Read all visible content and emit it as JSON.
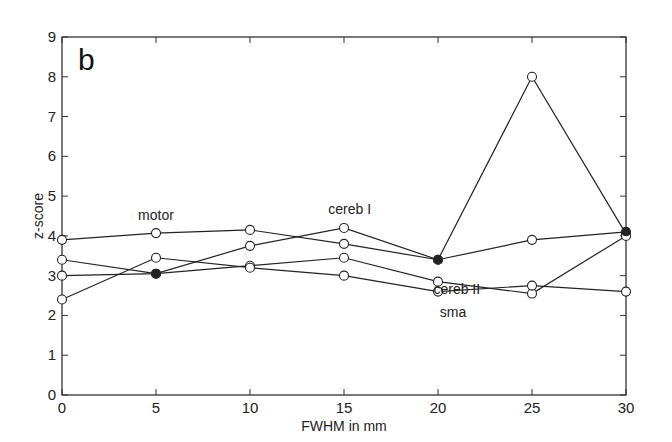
{
  "chart_data": {
    "type": "line",
    "panel_label": "b",
    "title": "",
    "xlabel": "FWHM in mm",
    "ylabel": "z-score",
    "xlim": [
      0,
      30
    ],
    "ylim": [
      0,
      9
    ],
    "x": [
      0,
      5,
      10,
      15,
      20,
      25,
      30
    ],
    "xticks": [
      0,
      5,
      10,
      15,
      20,
      25,
      30
    ],
    "yticks": [
      0,
      1,
      2,
      3,
      4,
      5,
      6,
      7,
      8,
      9
    ],
    "grid": false,
    "legend": "none (inline annotations)",
    "series": [
      {
        "name": "motor",
        "values": [
          3.9,
          4.07,
          4.15,
          3.8,
          3.4,
          3.9,
          4.1
        ]
      },
      {
        "name": "cereb I",
        "values": [
          3.4,
          3.05,
          3.75,
          4.2,
          3.4,
          8.0,
          4.05
        ]
      },
      {
        "name": "cereb II",
        "values": [
          3.0,
          3.05,
          3.25,
          3.45,
          2.85,
          2.55,
          4.0
        ]
      },
      {
        "name": "sma",
        "values": [
          2.4,
          3.45,
          3.2,
          3.0,
          2.6,
          2.75,
          2.6
        ]
      }
    ],
    "annotations": [
      {
        "text": "motor",
        "x": 5,
        "y": 4.4
      },
      {
        "text": "cereb I",
        "x": 15.3,
        "y": 4.55
      },
      {
        "text": "cereb II",
        "x": 21,
        "y": 2.55
      },
      {
        "text": "sma",
        "x": 20.8,
        "y": 1.95
      }
    ],
    "filled_markers": [
      {
        "x": 5,
        "y": 3.05
      },
      {
        "x": 20,
        "y": 3.4
      },
      {
        "x": 30,
        "y": 4.1
      }
    ]
  }
}
